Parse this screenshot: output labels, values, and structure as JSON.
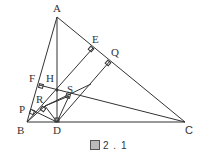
{
  "figure": {
    "caption": "2 . 1",
    "caption_prefix_icon": "figure-kanji-glyph",
    "points": {
      "A": {
        "label": "A",
        "x": 57,
        "y": 17
      },
      "B": {
        "label": "B",
        "x": 27,
        "y": 122
      },
      "C": {
        "label": "C",
        "x": 185,
        "y": 122
      },
      "D": {
        "label": "D",
        "x": 57,
        "y": 122
      },
      "E": {
        "label": "E",
        "x": 93,
        "y": 48
      },
      "F": {
        "label": "F",
        "x": 39,
        "y": 85
      },
      "H": {
        "label": "H",
        "x": 57,
        "y": 90
      },
      "Q": {
        "label": "Q",
        "x": 110,
        "y": 61
      },
      "S": {
        "label": "S",
        "x": 69,
        "y": 96
      },
      "R": {
        "label": "R",
        "x": 45,
        "y": 106
      },
      "P": {
        "label": "P",
        "x": 32,
        "y": 110
      }
    },
    "segments": [
      [
        "A",
        "B"
      ],
      [
        "B",
        "C"
      ],
      [
        "C",
        "A"
      ],
      [
        "A",
        "D"
      ],
      [
        "B",
        "E"
      ],
      [
        "C",
        "F"
      ],
      [
        "D",
        "Q"
      ],
      [
        "D",
        "S"
      ],
      [
        "D",
        "P"
      ],
      [
        "D",
        "R"
      ],
      [
        "R",
        "S"
      ],
      [
        "B",
        "R"
      ]
    ],
    "right_angle_marks": [
      "E",
      "F",
      "Q",
      "S",
      "P",
      "R",
      "D"
    ],
    "stroke_color": "#333333"
  }
}
